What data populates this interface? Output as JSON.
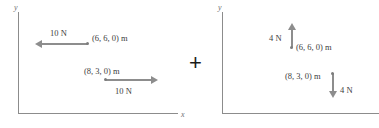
{
  "figure": {
    "operator": "+",
    "axis_labels": {
      "x": "x",
      "y": "y"
    },
    "panels": [
      {
        "id": "left",
        "name": "force-system-a",
        "axis": {
          "x_label": "x",
          "y_label": "y"
        },
        "vectors": [
          {
            "id": "left-upper",
            "magnitude_label": "10 N",
            "position_label": "(6, 6, 0) m",
            "direction": "left",
            "magnitude_value": 10,
            "units": "N",
            "position": [
              6,
              6,
              0
            ],
            "position_units": "m"
          },
          {
            "id": "left-lower",
            "magnitude_label": "10 N",
            "position_label": "(8, 3, 0) m",
            "direction": "right",
            "magnitude_value": 10,
            "units": "N",
            "position": [
              8,
              3,
              0
            ],
            "position_units": "m"
          }
        ]
      },
      {
        "id": "right",
        "name": "force-system-b",
        "axis": {
          "x_label": "",
          "y_label": "y"
        },
        "vectors": [
          {
            "id": "right-upper",
            "magnitude_label": "4 N",
            "position_label": "(6, 6, 0) m",
            "direction": "up",
            "magnitude_value": 4,
            "units": "N",
            "position": [
              6,
              6,
              0
            ],
            "position_units": "m"
          },
          {
            "id": "right-lower",
            "magnitude_label": "4 N",
            "position_label": "(8, 3, 0) m",
            "direction": "down",
            "magnitude_value": 4,
            "units": "N",
            "position": [
              8,
              3,
              0
            ],
            "position_units": "m"
          }
        ]
      }
    ],
    "colors": {
      "vector": "#8d8d8d",
      "axis": "#8c8c8c",
      "text": "#3d3d3d",
      "operator": "#1a1a1a",
      "background": "#ffffff"
    }
  }
}
